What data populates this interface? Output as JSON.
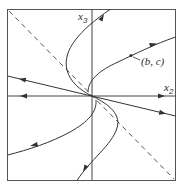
{
  "diagram": {
    "colors": {
      "line": "#333333",
      "dashed": "#555555",
      "background": "#ffffff"
    },
    "axes": {
      "horizontal": {
        "label": "x",
        "subscript": "2"
      },
      "vertical": {
        "label": "x",
        "subscript": "3"
      }
    },
    "point_label": {
      "text": "(b, c)"
    },
    "elements": [
      "frame",
      "horizontal-axis x2 with outward arrows",
      "vertical-axis x3",
      "dashed diagonal line",
      "straight trajectory through origin with outward arrows",
      "S-shaped trajectory through origin",
      "upper-right trajectory through point (b, c)",
      "lower-left trajectory"
    ]
  }
}
